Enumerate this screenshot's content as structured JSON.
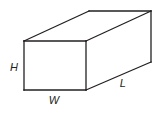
{
  "figure": {
    "kind": "rectangular-prism-diagram",
    "canvas": {
      "width": 164,
      "height": 114,
      "background": "#ffffff"
    },
    "stroke": {
      "color": "#231f20",
      "width": 1.3,
      "fill": "none"
    },
    "geometry": {
      "front_face": {
        "name": "front-face",
        "top_left": [
          24,
          41
        ],
        "top_right": [
          86,
          41
        ],
        "bottom_right": [
          86,
          90
        ],
        "bottom_left": [
          24,
          90
        ]
      },
      "depth_offset": [
        65,
        -30
      ],
      "back_face_visible_corners": {
        "top_left": [
          89,
          11
        ],
        "top_right": [
          151,
          11
        ],
        "bottom_right": [
          151,
          62
        ]
      },
      "edges": [
        {
          "name": "front-top-edge",
          "from": [
            24,
            41
          ],
          "to": [
            86,
            41
          ]
        },
        {
          "name": "front-right-edge",
          "from": [
            86,
            41
          ],
          "to": [
            86,
            90
          ]
        },
        {
          "name": "front-bottom-edge",
          "from": [
            86,
            90
          ],
          "to": [
            24,
            90
          ]
        },
        {
          "name": "front-left-edge",
          "from": [
            24,
            90
          ],
          "to": [
            24,
            41
          ]
        },
        {
          "name": "top-left-depth-edge",
          "from": [
            24,
            41
          ],
          "to": [
            89,
            11
          ]
        },
        {
          "name": "top-back-edge",
          "from": [
            89,
            11
          ],
          "to": [
            151,
            11
          ]
        },
        {
          "name": "top-right-depth-edge",
          "from": [
            86,
            41
          ],
          "to": [
            151,
            11
          ]
        },
        {
          "name": "back-right-vertical-edge",
          "from": [
            151,
            11
          ],
          "to": [
            151,
            62
          ]
        },
        {
          "name": "bottom-right-depth-edge",
          "from": [
            86,
            90
          ],
          "to": [
            151,
            62
          ]
        }
      ]
    },
    "labels": {
      "height": {
        "text": "H",
        "edge": "front-left-edge",
        "position": [
          14,
          67
        ]
      },
      "width": {
        "text": "W",
        "edge": "front-bottom-edge",
        "position": [
          54,
          100
        ]
      },
      "length": {
        "text": "L",
        "edge": "bottom-right-depth-edge",
        "position": [
          123,
          83
        ]
      }
    }
  }
}
